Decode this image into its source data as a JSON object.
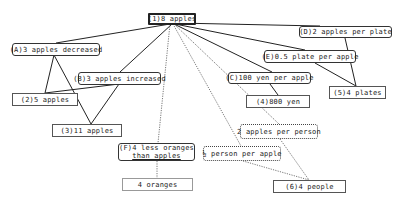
{
  "diagram": {
    "nodes": [
      {
        "id": "n1",
        "label": "(1)8 apples",
        "style": "bold"
      },
      {
        "id": "nA",
        "label": "(A)3 apples decreased",
        "style": "rounded"
      },
      {
        "id": "nB",
        "label": "(B)3 apples increased",
        "style": "rounded"
      },
      {
        "id": "n2",
        "label": "(2)5 apples",
        "style": "square"
      },
      {
        "id": "n3",
        "label": "(3)11 apples",
        "style": "square"
      },
      {
        "id": "nD",
        "label": "(D)2 apples per plate",
        "style": "rounded"
      },
      {
        "id": "nE",
        "label": "(E)0.5 plate per apple",
        "style": "rounded"
      },
      {
        "id": "nC",
        "label": "(C)100 yen per apple",
        "style": "rounded"
      },
      {
        "id": "n4",
        "label": "(4)800 yen",
        "style": "square"
      },
      {
        "id": "n5",
        "label": "(5)4 plates",
        "style": "square"
      },
      {
        "id": "nP",
        "label": "2 apples per person",
        "style": "dotted"
      },
      {
        "id": "nH",
        "label": "½ person per apple",
        "style": "dotted"
      },
      {
        "id": "nF",
        "label_line1": "(F)4 less oranges",
        "label_line2": "than apples",
        "style": "rounded"
      },
      {
        "id": "nO",
        "label": "4 oranges",
        "style": "thin"
      },
      {
        "id": "n6",
        "label": "(6)4 people",
        "style": "square"
      }
    ],
    "edges": [
      {
        "from": "(1)8 apples",
        "to": "(A)3 apples decreased",
        "style": "solid"
      },
      {
        "from": "(1)8 apples",
        "to": "(B)3 apples increased",
        "style": "solid"
      },
      {
        "from": "(1)8 apples",
        "to": "(D)2 apples per plate",
        "style": "solid"
      },
      {
        "from": "(1)8 apples",
        "to": "(E)0.5 plate per apple",
        "style": "solid"
      },
      {
        "from": "(1)8 apples",
        "to": "(C)100 yen per apple",
        "style": "solid"
      },
      {
        "from": "(1)8 apples",
        "to": "(F)4 less oranges than apples",
        "style": "dotted"
      },
      {
        "from": "(1)8 apples",
        "to": "2 apples per person",
        "style": "dotted"
      },
      {
        "from": "(1)8 apples",
        "to": "½ person per apple",
        "style": "dotted"
      },
      {
        "from": "(A)3 apples decreased",
        "to": "(2)5 apples",
        "style": "solid"
      },
      {
        "from": "(A)3 apples decreased",
        "to": "(3)11 apples",
        "style": "solid"
      },
      {
        "from": "(B)3 apples increased",
        "to": "(2)5 apples",
        "style": "solid"
      },
      {
        "from": "(B)3 apples increased",
        "to": "(3)11 apples",
        "style": "solid"
      },
      {
        "from": "(D)2 apples per plate",
        "to": "(5)4 plates",
        "style": "solid"
      },
      {
        "from": "(E)0.5 plate per apple",
        "to": "(5)4 plates",
        "style": "solid"
      },
      {
        "from": "(C)100 yen per apple",
        "to": "(4)800 yen",
        "style": "solid"
      },
      {
        "from": "2 apples per person",
        "to": "(6)4 people",
        "style": "dotted"
      },
      {
        "from": "½ person per apple",
        "to": "(6)4 people",
        "style": "dotted"
      },
      {
        "from": "(F)4 less oranges than apples",
        "to": "4 oranges",
        "style": "dotted"
      }
    ]
  }
}
